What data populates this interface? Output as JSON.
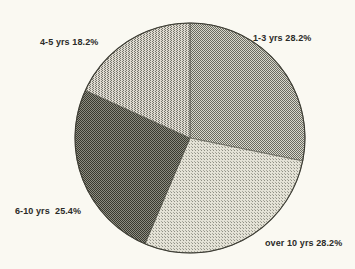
{
  "background_color": "#faf9f2",
  "chart_data": {
    "type": "pie",
    "title": "",
    "subtitle": "",
    "xlabel": "",
    "ylabel": "",
    "grid": false,
    "legend_position": "none",
    "label_format": "{name} {value}%",
    "start_angle_deg": 0,
    "direction": "clockwise",
    "center": {
      "x": 190,
      "y": 138
    },
    "radius": 115,
    "categories": [
      "1-3 yrs",
      "over 10 yrs",
      "6-10 yrs",
      "4-5 yrs"
    ],
    "values": [
      28.2,
      28.2,
      25.4,
      18.2
    ],
    "slices": [
      {
        "name": "1-3 yrs",
        "value": 28.2,
        "label": "1-3 yrs 28.2%",
        "fill_tone": "medium",
        "fill_color": "#9a9a8f",
        "start_deg": 0,
        "end_deg": 101.52
      },
      {
        "name": "over 10 yrs",
        "value": 28.2,
        "label": "over 10 yrs 28.2%",
        "fill_tone": "light",
        "fill_color": "#cfcfc2",
        "start_deg": 101.52,
        "end_deg": 203.04
      },
      {
        "name": "6-10 yrs",
        "value": 25.4,
        "label": "6-10 yrs  25.4%",
        "fill_tone": "dark",
        "fill_color": "#6f6f66",
        "start_deg": 203.04,
        "end_deg": 294.48
      },
      {
        "name": "4-5 yrs",
        "value": 18.2,
        "label": "4-5 yrs 18.2%",
        "fill_tone": "medium-light",
        "fill_color": "#b0b0a4",
        "start_deg": 294.48,
        "end_deg": 360
      }
    ]
  },
  "labels": {
    "top_right": "1-3 yrs 28.2%",
    "bottom_right": "over 10 yrs 28.2%",
    "bottom_left": "6-10 yrs  25.4%",
    "top_left": "4-5 yrs 18.2%"
  }
}
